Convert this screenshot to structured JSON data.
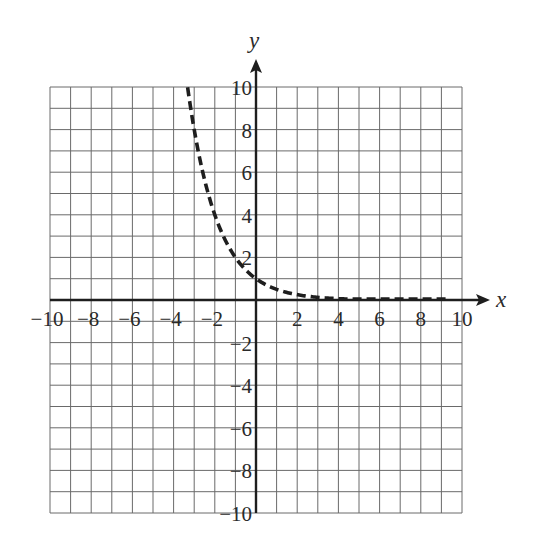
{
  "chart_data": {
    "type": "line",
    "title": "",
    "xlabel": "x",
    "ylabel": "y",
    "xlim": [
      -10,
      10
    ],
    "ylim": [
      -10,
      10
    ],
    "grid": true,
    "x_ticks": [
      -10,
      -8,
      -6,
      -4,
      -2,
      2,
      4,
      6,
      8,
      10
    ],
    "y_ticks": [
      10,
      8,
      6,
      4,
      2,
      -2,
      -4,
      -6,
      -8,
      -10
    ],
    "x_tick_labels": [
      "−10",
      "−8",
      "−6",
      "−4",
      "−2",
      "2",
      "4",
      "6",
      "8",
      "10"
    ],
    "y_tick_labels": [
      "10",
      "8",
      "6",
      "4",
      "2",
      "−2",
      "−4",
      "−6",
      "−8",
      "−10"
    ],
    "series": [
      {
        "name": "y = (1/2)^x",
        "style": "dashed",
        "color": "#1e1e1e",
        "x": [
          -3.32,
          -3,
          -2.5,
          -2,
          -1.5,
          -1,
          -0.5,
          0,
          0.5,
          1,
          1.5,
          2,
          3,
          4,
          5,
          6,
          7,
          8,
          9,
          10
        ],
        "y": [
          10,
          8,
          5.66,
          4,
          2.83,
          2,
          1.41,
          1,
          0.71,
          0.5,
          0.35,
          0.25,
          0.125,
          0.0625,
          0.031,
          0.016,
          0.008,
          0.004,
          0.002,
          0.001
        ]
      }
    ]
  },
  "axes": {
    "x_label": "x",
    "y_label": "y"
  },
  "colors": {
    "grid": "#6a6a6a",
    "axis": "#1e1e1e",
    "text": "#2a2a2a"
  }
}
